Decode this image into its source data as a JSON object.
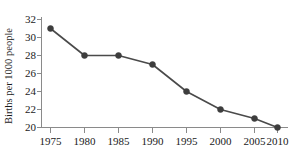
{
  "chart_data": {
    "type": "line",
    "title": "",
    "subtitle": "",
    "xlabel": "",
    "ylabel": "Births per 1000 people",
    "x": [
      1975,
      1980,
      1985,
      1990,
      1995,
      2000,
      2005,
      2010
    ],
    "values": [
      31,
      28,
      28,
      27,
      24,
      22,
      21,
      20
    ],
    "categories": [
      "1975",
      "1980",
      "1985",
      "1990",
      "1995",
      "2000",
      "2005",
      "2010"
    ],
    "xticklabels": [
      "1975",
      "1980",
      "1985",
      "1990",
      "1995",
      "2000",
      "2005",
      "2010"
    ],
    "yticklabels": [
      "20",
      "22",
      "24",
      "26",
      "28",
      "30",
      "32"
    ],
    "yticks": [
      20,
      22,
      24,
      26,
      28,
      30,
      32
    ],
    "xlim": [
      1975,
      2010
    ],
    "ylim": [
      20,
      32
    ],
    "grid": false,
    "legend": false,
    "legend_position": "none",
    "marker": "filled-circle",
    "series": [
      {
        "name": "Births per 1000 people",
        "values": [
          31,
          28,
          28,
          27,
          24,
          22,
          21,
          20
        ]
      }
    ],
    "points": [
      {
        "x": "1975",
        "y": "31"
      },
      {
        "x": "1980",
        "y": "28"
      },
      {
        "x": "1985",
        "y": "28"
      },
      {
        "x": "1990",
        "y": "27"
      },
      {
        "x": "1995",
        "y": "24"
      },
      {
        "x": "2000",
        "y": "22"
      },
      {
        "x": "2005",
        "y": "21"
      },
      {
        "x": "2010",
        "y": "20"
      }
    ]
  },
  "colors": {
    "background": "#ffffff",
    "axis": "#8a8a8a",
    "line": "#4a4a4a",
    "marker": "#3d3d3d",
    "text": "#1a1a1a"
  }
}
